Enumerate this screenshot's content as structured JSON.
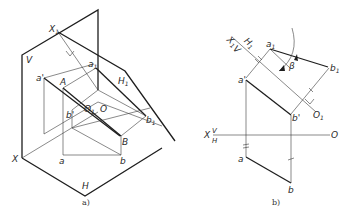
{
  "figure_a": {
    "caption": "a)",
    "labels": {
      "X1": "X",
      "X1_sub": "1",
      "V": "V",
      "a_prime": "a'",
      "A": "A",
      "a1": "a",
      "a1_sub": "1",
      "H1": "H",
      "H1_sub": "1",
      "O1": "O",
      "O1_sub": "1",
      "O": "O",
      "b_prime": "b'",
      "b1": "b",
      "b1_sub": "1",
      "B": "B",
      "X": "X",
      "a": "a",
      "b": "b",
      "H": "H"
    }
  },
  "figure_b": {
    "caption": "b)",
    "labels": {
      "X1": "X",
      "X1_sub": "1",
      "V_upper": "V",
      "H1": "H",
      "H1_sub": "1",
      "a1": "a",
      "a1_sub": "1",
      "beta": "β",
      "b1": "b",
      "b1_sub": "1",
      "a_prime": "a'",
      "b_prime": "b'",
      "O1": "O",
      "O1_sub": "1",
      "X": "X",
      "V": "V",
      "H": "H",
      "O": "O",
      "a": "a",
      "b": "b"
    }
  },
  "colors": {
    "line": "#1e1e1e",
    "text": "#2a2a2a",
    "background": "#ffffff"
  }
}
